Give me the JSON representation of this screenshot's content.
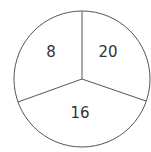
{
  "diagram": {
    "type": "circle-divided-into-three-sectors",
    "corner_label": ")",
    "sectors": [
      {
        "position": "upper-left",
        "value": "8"
      },
      {
        "position": "upper-right",
        "value": "20"
      },
      {
        "position": "bottom",
        "value": "16"
      }
    ],
    "colors": {
      "stroke": "#555555",
      "text": "#333333",
      "background": "#ffffff"
    }
  }
}
